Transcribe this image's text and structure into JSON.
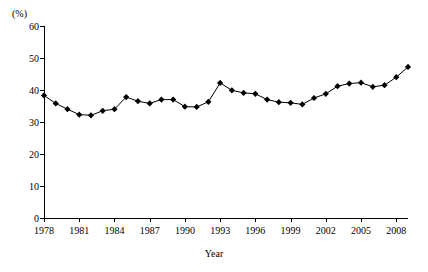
{
  "chart_data": {
    "type": "line",
    "title": "",
    "subtitle": "",
    "xlabel": "Year",
    "ylabel": "",
    "yunit": "(%)",
    "ylim": [
      0,
      60
    ],
    "xlim": [
      1978,
      2009
    ],
    "grid": false,
    "legend": null,
    "marker": "diamond",
    "ytick_labels": [
      "0",
      "10",
      "20",
      "30",
      "40",
      "50",
      "60"
    ],
    "ytick_values": [
      0,
      10,
      20,
      30,
      40,
      50,
      60
    ],
    "xtick_labels": [
      "1978",
      "1981",
      "1984",
      "1987",
      "1990",
      "1993",
      "1996",
      "1999",
      "2002",
      "2005",
      "2008"
    ],
    "xtick_values": [
      1978,
      1981,
      1984,
      1987,
      1990,
      1993,
      1996,
      1999,
      2002,
      2005,
      2008
    ],
    "x": [
      1978,
      1979,
      1980,
      1981,
      1982,
      1983,
      1984,
      1985,
      1986,
      1987,
      1988,
      1989,
      1990,
      1991,
      1992,
      1993,
      1994,
      1995,
      1996,
      1997,
      1998,
      1999,
      2000,
      2001,
      2002,
      2003,
      2004,
      2005,
      2006,
      2007,
      2008,
      2009
    ],
    "values": [
      38.3,
      35.8,
      34.0,
      32.3,
      32.1,
      33.5,
      34.0,
      37.8,
      36.5,
      35.8,
      37.0,
      37.0,
      34.8,
      34.7,
      36.3,
      42.2,
      39.9,
      39.1,
      38.8,
      37.0,
      36.2,
      36.0,
      35.5,
      37.5,
      38.8,
      41.2,
      42.0,
      42.3,
      41.0,
      41.5,
      44.0,
      47.2
    ],
    "series_name": ""
  }
}
